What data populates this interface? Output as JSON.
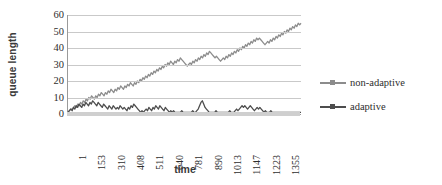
{
  "chart_data": {
    "type": "line",
    "title": "",
    "xlabel": "time",
    "ylabel": "queue length",
    "grid": "horizontal",
    "legend_position": "right",
    "ylim": [
      0,
      60
    ],
    "yticks": [
      0,
      10,
      20,
      30,
      40,
      50,
      60
    ],
    "xtick_labels": [
      "1",
      "153",
      "310",
      "408",
      "511",
      "640",
      "781",
      "890",
      "1013",
      "1147",
      "1223",
      "1355"
    ],
    "series": [
      {
        "name": "non-adaptive",
        "color": "#8c8c8c",
        "values": [
          1,
          2,
          3,
          3,
          4,
          5,
          4,
          6,
          5,
          7,
          6,
          8,
          7,
          9,
          8,
          10,
          9,
          11,
          10,
          9,
          11,
          10,
          12,
          11,
          13,
          12,
          11,
          13,
          12,
          14,
          13,
          15,
          14,
          13,
          15,
          14,
          16,
          15,
          17,
          16,
          15,
          17,
          16,
          18,
          17,
          19,
          18,
          17,
          19,
          18,
          20,
          19,
          21,
          20,
          22,
          21,
          23,
          22,
          24,
          23,
          25,
          24,
          26,
          25,
          27,
          26,
          28,
          27,
          29,
          28,
          30,
          29,
          31,
          30,
          32,
          31,
          30,
          32,
          31,
          33,
          32,
          34,
          33,
          32,
          31,
          30,
          29,
          30,
          31,
          30,
          32,
          31,
          33,
          32,
          34,
          33,
          35,
          34,
          36,
          35,
          37,
          36,
          38,
          37,
          36,
          35,
          34,
          35,
          34,
          33,
          32,
          33,
          34,
          33,
          35,
          34,
          36,
          35,
          37,
          36,
          38,
          37,
          39,
          38,
          40,
          39,
          41,
          40,
          42,
          41,
          43,
          42,
          44,
          43,
          45,
          44,
          46,
          45,
          46,
          45,
          44,
          43,
          42,
          43,
          44,
          43,
          45,
          44,
          46,
          45,
          47,
          46,
          48,
          47,
          49,
          48,
          50,
          49,
          51,
          50,
          52,
          51,
          53,
          52,
          54,
          53,
          55,
          54,
          55
        ]
      },
      {
        "name": "adaptive",
        "color": "#4d4d4d",
        "values": [
          1,
          2,
          3,
          2,
          4,
          3,
          5,
          4,
          6,
          5,
          4,
          6,
          5,
          7,
          6,
          5,
          7,
          6,
          8,
          7,
          6,
          5,
          7,
          6,
          5,
          4,
          6,
          5,
          4,
          3,
          5,
          4,
          3,
          5,
          4,
          3,
          4,
          3,
          5,
          4,
          3,
          4,
          3,
          2,
          4,
          3,
          5,
          4,
          6,
          5,
          4,
          3,
          2,
          1,
          2,
          1,
          2,
          3,
          2,
          4,
          3,
          2,
          4,
          3,
          5,
          4,
          3,
          5,
          4,
          3,
          2,
          4,
          3,
          2,
          1,
          2,
          1,
          2,
          1,
          1,
          1,
          1,
          1,
          2,
          1,
          1,
          1,
          1,
          1,
          1,
          1,
          2,
          1,
          1,
          2,
          3,
          5,
          7,
          8,
          6,
          4,
          3,
          2,
          1,
          1,
          1,
          1,
          1,
          2,
          1,
          1,
          1,
          1,
          1,
          1,
          1,
          1,
          1,
          2,
          1,
          1,
          1,
          2,
          3,
          2,
          3,
          4,
          5,
          4,
          5,
          4,
          3,
          4,
          5,
          4,
          3,
          2,
          3,
          4,
          3,
          4,
          3,
          2,
          1,
          2,
          1,
          1,
          1,
          2,
          1,
          1,
          1,
          1,
          1,
          1,
          1,
          1,
          1,
          1,
          1,
          1,
          1,
          1,
          1,
          1,
          1,
          1,
          1,
          1,
          1,
          1
        ]
      }
    ]
  },
  "legend": {
    "items": [
      {
        "label": "non-adaptive",
        "color": "#8c8c8c"
      },
      {
        "label": "adaptive",
        "color": "#4d4d4d"
      }
    ]
  },
  "axes": {
    "y_title": "queue length",
    "x_title": "time"
  }
}
